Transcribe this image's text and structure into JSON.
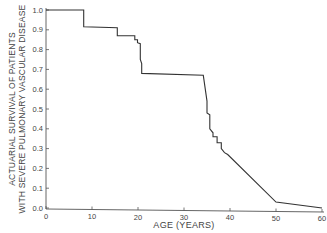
{
  "chart_data": {
    "type": "line",
    "style": "step",
    "title": "",
    "xlabel": "AGE (YEARS)",
    "ylabel_lines": [
      "ACTUARIAL SURVIVAL OF PATIENTS",
      "WITH SEVERE PULMONARY VASCULAR DISEASE"
    ],
    "xlim": [
      0,
      60
    ],
    "ylim": [
      0.0,
      1.0
    ],
    "x_ticks": [
      0,
      10,
      20,
      30,
      40,
      50,
      60
    ],
    "y_ticks": [
      "0.0",
      "0.1",
      "0.2",
      "0.3",
      "0.4",
      "0.5",
      "0.6",
      "0.7",
      "0.8",
      "0.9",
      "1.0"
    ],
    "grid": false,
    "legend": null,
    "series": [
      {
        "name": "Actuarial survival",
        "color": "#333333",
        "points": [
          [
            0,
            1.0
          ],
          [
            8.2,
            1.0
          ],
          [
            8.2,
            0.915
          ],
          [
            15.5,
            0.91
          ],
          [
            15.5,
            0.87
          ],
          [
            19.3,
            0.87
          ],
          [
            19.3,
            0.85
          ],
          [
            19.9,
            0.85
          ],
          [
            19.9,
            0.835
          ],
          [
            20.5,
            0.83
          ],
          [
            20.5,
            0.75
          ],
          [
            20.8,
            0.73
          ],
          [
            20.8,
            0.68
          ],
          [
            34.2,
            0.67
          ],
          [
            35.0,
            0.54
          ],
          [
            35.0,
            0.48
          ],
          [
            35.6,
            0.47
          ],
          [
            35.6,
            0.4
          ],
          [
            36.3,
            0.38
          ],
          [
            36.3,
            0.36
          ],
          [
            37.2,
            0.36
          ],
          [
            37.2,
            0.33
          ],
          [
            38.1,
            0.33
          ],
          [
            38.1,
            0.3
          ],
          [
            38.8,
            0.28
          ],
          [
            39.5,
            0.27
          ],
          [
            50,
            0.03
          ],
          [
            60,
            0.0
          ]
        ]
      }
    ]
  }
}
